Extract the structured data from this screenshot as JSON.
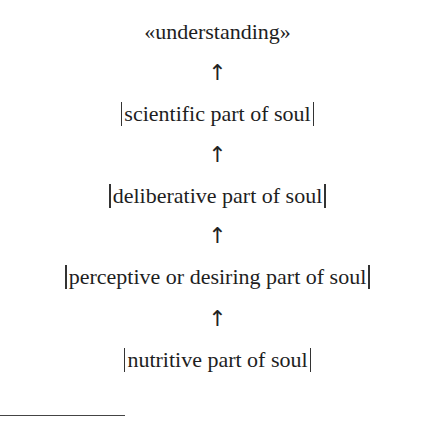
{
  "diagram": {
    "top_label": "«understanding»",
    "arrow_glyph": "↑",
    "levels": [
      {
        "label": "scientific part of soul"
      },
      {
        "label": "deliberative part of soul"
      },
      {
        "label": "perceptive or desiring part of soul"
      },
      {
        "label": "nutritive part of soul"
      }
    ]
  }
}
